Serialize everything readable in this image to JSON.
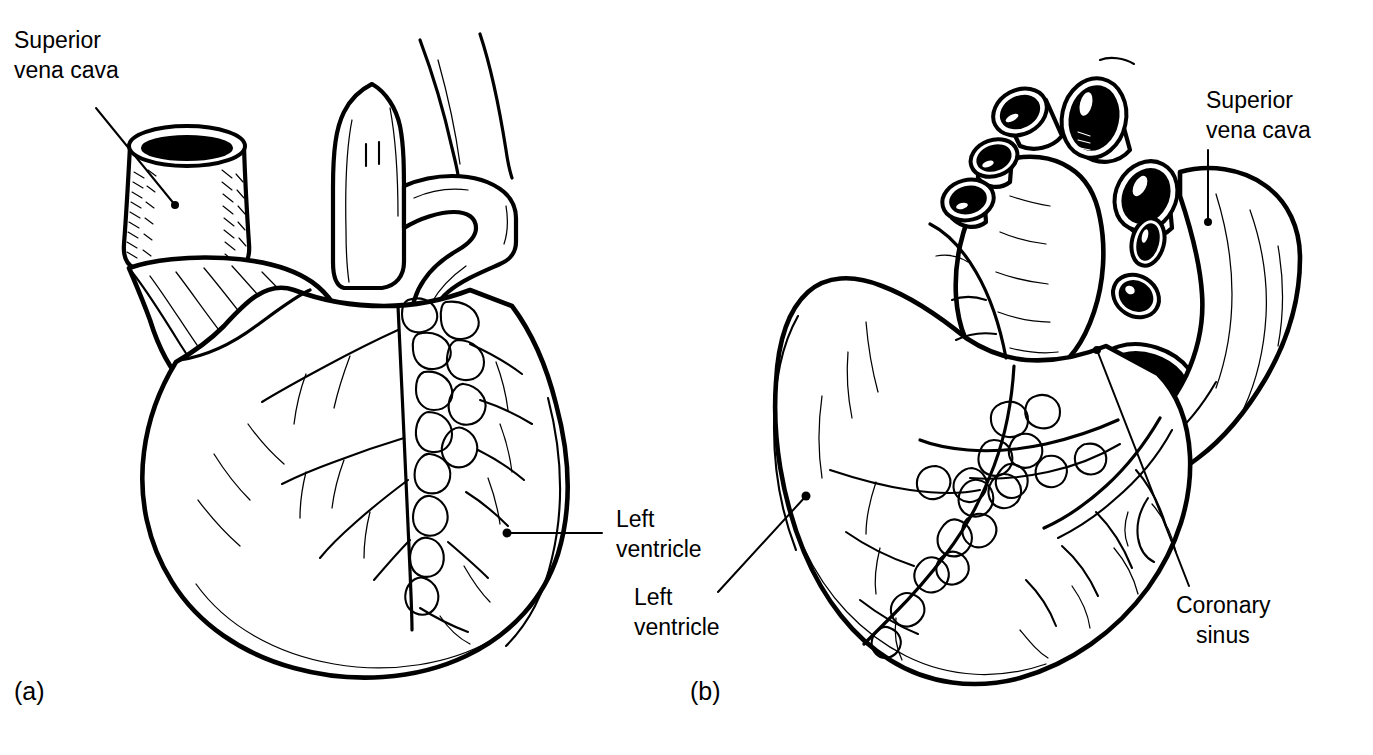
{
  "figure": {
    "background_color": "#ffffff",
    "ink_color": "#000000",
    "style": "black-and-white anatomical line drawing"
  },
  "panels": [
    {
      "id": "a",
      "letter": "(a)",
      "view": "anterior",
      "labels": [
        {
          "id": "svc-a",
          "name": "superior-vena-cava",
          "line1": "Superior",
          "line2": "vena cava",
          "text_x": 14,
          "text_y1": 48,
          "text_y2": 78,
          "leader": {
            "x1": 96,
            "y1": 108,
            "x2": 175,
            "y2": 205
          },
          "dot": {
            "cx": 175,
            "cy": 205,
            "r": 4
          }
        },
        {
          "id": "lv-a",
          "name": "left-ventricle",
          "line1": "Left",
          "line2": "ventricle",
          "text_x": 616,
          "text_y1": 527,
          "text_y2": 557,
          "leader": {
            "x1": 602,
            "y1": 533,
            "x2": 507,
            "y2": 533
          },
          "dot": {
            "cx": 507,
            "cy": 533,
            "r": 4.5
          }
        }
      ]
    },
    {
      "id": "b",
      "letter": "(b)",
      "view": "posterior",
      "labels": [
        {
          "id": "svc-b",
          "name": "superior-vena-cava",
          "line1": "Superior",
          "line2": "vena cava",
          "text_x": 1206,
          "text_y1": 108,
          "text_y2": 138,
          "leader": {
            "x1": 1208,
            "y1": 148,
            "x2": 1208,
            "y2": 222
          },
          "dot": {
            "cx": 1208,
            "cy": 222,
            "r": 4
          }
        },
        {
          "id": "lv-b",
          "name": "left-ventricle",
          "line1": "Left",
          "line2": "ventricle",
          "text_x": 634,
          "text_y1": 605,
          "text_y2": 635,
          "leader": {
            "x1": 718,
            "y1": 592,
            "x2": 806,
            "y2": 496
          },
          "dot": {
            "cx": 806,
            "cy": 496,
            "r": 4.5
          }
        },
        {
          "id": "cs-b",
          "name": "coronary-sinus",
          "line1": "Coronary",
          "line2": "sinus",
          "text_x": 1176,
          "text_y1": 613,
          "text_y2": 643,
          "leader": {
            "x1": 1189,
            "y1": 586,
            "x2": 1097,
            "y2": 350
          },
          "dot": {
            "cx": 1097,
            "cy": 350,
            "r": 4
          }
        }
      ],
      "panel_letter_x": 690,
      "panel_letter_y": 700
    }
  ],
  "panel_letters": {
    "a": {
      "text": "(a)",
      "x": 14,
      "y": 700
    },
    "b": {
      "text": "(b)",
      "x": 690,
      "y": 700
    }
  },
  "anatomy_features": {
    "panel_a": [
      "superior vena cava (cut, hatched)",
      "ascending aorta",
      "pulmonary trunk",
      "right atrium / right auricle",
      "right ventricle",
      "anterior interventricular groove with epicardial fat",
      "left ventricle",
      "apex of heart"
    ],
    "panel_b": [
      "pulmonary veins (cut ends)",
      "superior vena cava (cut end)",
      "inferior vena cava (cut end)",
      "left atrium",
      "right atrium",
      "coronary sinus",
      "posterior interventricular groove",
      "left ventricle",
      "right ventricle",
      "apex of heart"
    ]
  }
}
